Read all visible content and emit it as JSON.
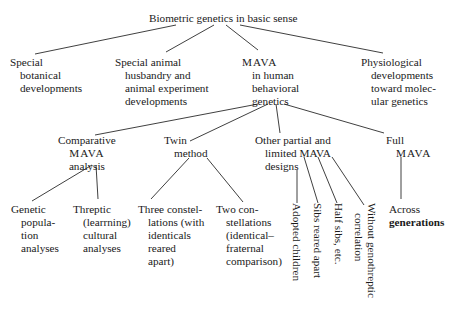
{
  "root": {
    "label": "Biometric genetics in basic sense"
  },
  "level1": [
    {
      "lines": [
        "Special",
        "botanical",
        "developments"
      ]
    },
    {
      "lines": [
        "Special animal",
        "husbandry and",
        "animal experiment",
        "developments"
      ]
    },
    {
      "lines": [
        "MAVA",
        "in human",
        "behavioral",
        "genetics"
      ]
    },
    {
      "lines": [
        "Physiological",
        "developments",
        "toward molec-",
        "ular genetics"
      ]
    }
  ],
  "level2": [
    {
      "lines": [
        "Comparative",
        "MAVA",
        "analysis"
      ]
    },
    {
      "lines": [
        "Twin",
        "method"
      ]
    },
    {
      "lines": [
        "Other partial and",
        "limited MAVA",
        "designs"
      ]
    },
    {
      "lines": [
        "Full",
        "MAVA"
      ]
    }
  ],
  "level3": {
    "comparative": [
      {
        "lines": [
          "Genetic",
          "popula-",
          "tion",
          "analyses"
        ]
      },
      {
        "lines": [
          "Threptic",
          "(learrning)",
          "cultural",
          "analyses"
        ]
      }
    ],
    "twin": [
      {
        "lines": [
          "Three constel-",
          "lations (with",
          "identicals",
          "reared",
          "apart)"
        ]
      },
      {
        "lines": [
          "Two con-",
          "stellations",
          "(identical–",
          "fraternal",
          "comparison)"
        ]
      }
    ],
    "other_partial": [
      {
        "label": "Adopted children"
      },
      {
        "label": "Sibs reared apart"
      },
      {
        "label": "Half sibs, etc."
      },
      {
        "lines": [
          "Without genothreptic",
          "correlation"
        ]
      }
    ],
    "full": [
      {
        "lines": [
          "Across",
          "generations"
        ]
      }
    ]
  }
}
